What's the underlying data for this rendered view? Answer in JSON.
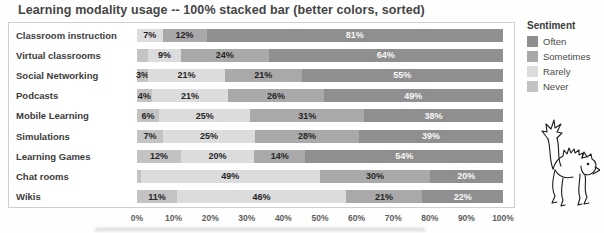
{
  "title": "Learning modality usage -- 100% stacked bar (better colors, sorted)",
  "legend": {
    "title": "Sentiment",
    "items": [
      {
        "label": "Often",
        "color": "#8f8f8f"
      },
      {
        "label": "Sometimes",
        "color": "#a9a9a9"
      },
      {
        "label": "Rarely",
        "color": "#dcdcdc"
      },
      {
        "label": "Never",
        "color": "#c3c3c3"
      }
    ]
  },
  "axis": {
    "ticks": [
      "0%",
      "10%",
      "20%",
      "30%",
      "40%",
      "50%",
      "60%",
      "70%",
      "80%",
      "90%",
      "100%"
    ]
  },
  "decor": {
    "cat_doodle": "scared-cat-line-drawing"
  },
  "chart_data": {
    "type": "bar",
    "orientation": "horizontal",
    "stacked": true,
    "stack_total": 100,
    "title": "Learning modality usage -- 100% stacked bar (better colors, sorted)",
    "xlabel": "",
    "ylabel": "",
    "xlim": [
      0,
      100
    ],
    "grid": false,
    "legend_position": "right",
    "legend_title": "Sentiment",
    "categories": [
      "Classroom instruction",
      "Virtual classrooms",
      "Social Networking",
      "Podcasts",
      "Mobile Learning",
      "Simulations",
      "Learning Games",
      "Chat rooms",
      "Wikis"
    ],
    "series": [
      {
        "name": "Never",
        "color": "#c3c3c3",
        "label_color": "#262626",
        "values": [
          0,
          3,
          3,
          4,
          6,
          7,
          12,
          1,
          11
        ],
        "labels": [
          "",
          "",
          "3%",
          "4%",
          "6%",
          "7%",
          "12%",
          "",
          "11%"
        ]
      },
      {
        "name": "Rarely",
        "color": "#dcdcdc",
        "label_color": "#262626",
        "values": [
          7,
          9,
          21,
          21,
          25,
          25,
          20,
          49,
          46
        ],
        "labels": [
          "7%",
          "9%",
          "21%",
          "21%",
          "25%",
          "25%",
          "20%",
          "49%",
          "46%"
        ]
      },
      {
        "name": "Sometimes",
        "color": "#a9a9a9",
        "label_color": "#262626",
        "values": [
          12,
          24,
          21,
          26,
          31,
          28,
          14,
          30,
          21
        ],
        "labels": [
          "12%",
          "24%",
          "21%",
          "26%",
          "31%",
          "28%",
          "14%",
          "30%",
          "21%"
        ]
      },
      {
        "name": "Often",
        "color": "#8f8f8f",
        "label_color": "#f7f7f7",
        "values": [
          81,
          64,
          55,
          49,
          38,
          39,
          54,
          20,
          22
        ],
        "labels": [
          "81%",
          "64%",
          "55%",
          "49%",
          "38%",
          "39%",
          "54%",
          "20%",
          "22%"
        ]
      }
    ]
  }
}
